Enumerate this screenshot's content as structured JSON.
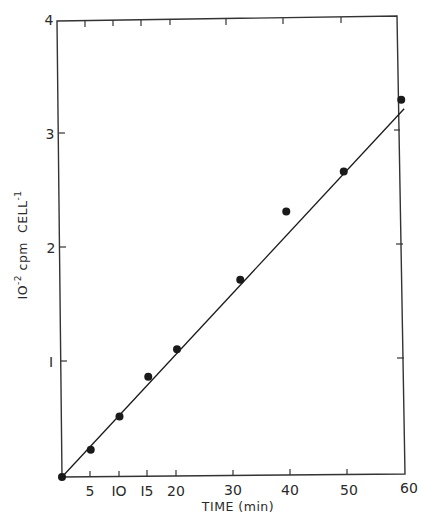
{
  "chart_data": {
    "type": "scatter",
    "title": "",
    "xlabel": "TIME (min)",
    "ylabel": "10^-2 cpm CELL^-1",
    "ylabel_parts": {
      "base": "IO",
      "exp1": "-2",
      "mid": " cpm  CELL",
      "exp2": "-1"
    },
    "xlim": [
      0,
      60
    ],
    "ylim": [
      0,
      4
    ],
    "x_ticks": [
      5,
      10,
      15,
      20,
      30,
      40,
      50,
      60
    ],
    "x_tick_labels": [
      "5",
      "IO",
      "I5",
      "20",
      "30",
      "40",
      "50",
      "60"
    ],
    "y_ticks": [
      1,
      2,
      3,
      4
    ],
    "y_tick_labels": [
      "I",
      "2",
      "3",
      "4"
    ],
    "grid": false,
    "legend": null,
    "series": [
      {
        "name": "measured",
        "marker": "filled-circle",
        "x": [
          0,
          5,
          10,
          15,
          20,
          31,
          39,
          49,
          59
        ],
        "y": [
          0,
          0.24,
          0.53,
          0.88,
          1.12,
          1.73,
          2.33,
          2.68,
          3.31
        ]
      },
      {
        "name": "linear fit",
        "style": "line",
        "x": [
          0,
          59.5
        ],
        "y": [
          0,
          3.23
        ]
      }
    ],
    "colors": {
      "ink": "#1a1a1a",
      "background": "#ffffff"
    }
  }
}
